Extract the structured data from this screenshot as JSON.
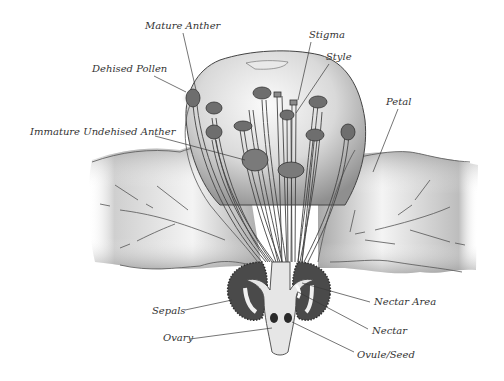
{
  "diagram": {
    "colors": {
      "background": "#ffffff",
      "label_text": "#333333",
      "leader_line": "#3a3a3a",
      "petal_fill_light": "#f2f2f2",
      "petal_fill_dark": "#9a9a9a",
      "anther_fill": "#6e6e6e",
      "sepal_fill": "#4a4a4a",
      "ovule_fill": "#2a2a2a"
    },
    "labels": [
      {
        "id": "mature-anther",
        "text": "Mature Anther",
        "x": 145,
        "y": 20
      },
      {
        "id": "dehised-pollen",
        "text": "Dehised Pollen",
        "x": 92,
        "y": 63
      },
      {
        "id": "immature-undehised-anther",
        "text": "Immature Undehised Anther",
        "x": 30,
        "y": 126
      },
      {
        "id": "stigma",
        "text": "Stigma",
        "x": 309,
        "y": 29
      },
      {
        "id": "style",
        "text": "Style",
        "x": 326,
        "y": 51
      },
      {
        "id": "petal",
        "text": "Petal",
        "x": 386,
        "y": 96
      },
      {
        "id": "sepals",
        "text": "Sepals",
        "x": 152,
        "y": 305
      },
      {
        "id": "ovary",
        "text": "Ovary",
        "x": 163,
        "y": 332
      },
      {
        "id": "nectar-area",
        "text": "Nectar Area",
        "x": 374,
        "y": 296
      },
      {
        "id": "nectar",
        "text": "Nectar",
        "x": 372,
        "y": 325
      },
      {
        "id": "ovule-seed",
        "text": "Ovule/Seed",
        "x": 357,
        "y": 349
      }
    ]
  }
}
